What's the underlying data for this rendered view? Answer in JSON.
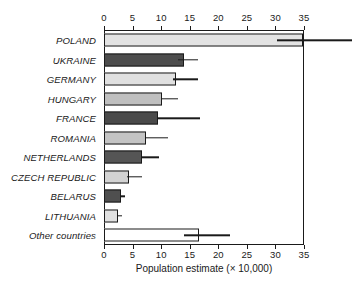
{
  "chart_data": {
    "type": "bar",
    "orientation": "horizontal",
    "title": "",
    "xlabel": "Population estimate (× 10,000)",
    "ylabel": "",
    "xlim": [
      0,
      35
    ],
    "xticks": [
      0,
      5,
      10,
      15,
      20,
      25,
      30,
      35
    ],
    "xtick_labels": [
      "0",
      "5",
      "10",
      "15",
      "20",
      "25",
      "30",
      "35"
    ],
    "grid": false,
    "legend": null,
    "axis_top": true,
    "axis_bottom": true,
    "categories": [
      "POLAND",
      "UKRAINE",
      "GERMANY",
      "HUNGARY",
      "FRANCE",
      "ROMANIA",
      "NETHERLANDS",
      "CZECH REPUBLIC",
      "BELARUS",
      "LITHUANIA",
      "Other countries"
    ],
    "values": [
      34.8,
      14.0,
      12.6,
      10.2,
      9.4,
      7.4,
      6.6,
      4.3,
      2.9,
      2.4,
      16.7
    ],
    "error_low": [
      30.2,
      13.0,
      12.0,
      10.0,
      9.2,
      7.2,
      6.4,
      4.0,
      2.8,
      2.2,
      14.0
    ],
    "error_high": [
      46.0,
      16.5,
      16.5,
      13.0,
      16.8,
      11.2,
      9.6,
      6.6,
      3.6,
      3.1,
      22.0
    ],
    "bar_colors": [
      "#e3e3e3",
      "#4d4d4d",
      "#e0e0e0",
      "#bfbfbf",
      "#4a4a4a",
      "#c4c4c4",
      "#555555",
      "#d3d3d3",
      "#4f4f4f",
      "#e0e0e0",
      "#ffffff"
    ],
    "bar_edge_color": "#1a1a1a",
    "error_color": "#1a1a1a"
  }
}
